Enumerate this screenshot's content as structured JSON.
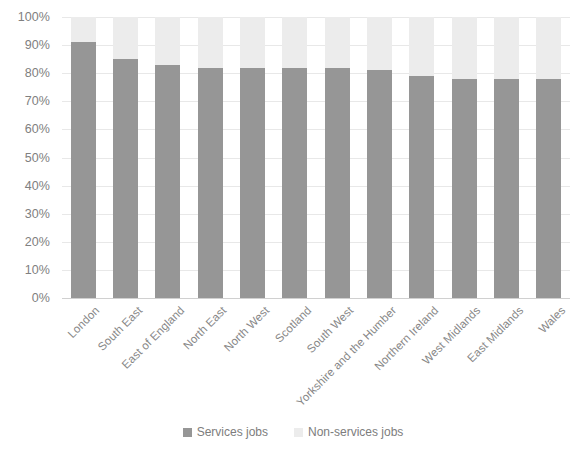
{
  "chart_data": {
    "type": "bar",
    "subtype": "stacked-percent-column",
    "title": "",
    "subtitle": "",
    "xlabel": "",
    "ylabel": "",
    "ylim": [
      0,
      100
    ],
    "y_tick_labels": [
      "0%",
      "10%",
      "20%",
      "30%",
      "40%",
      "50%",
      "60%",
      "70%",
      "80%",
      "90%",
      "100%"
    ],
    "y_tick_values": [
      0,
      10,
      20,
      30,
      40,
      50,
      60,
      70,
      80,
      90,
      100
    ],
    "grid": true,
    "grid_axis": "y",
    "legend_position": "bottom",
    "categories": [
      "London",
      "South East",
      "East of England",
      "North East",
      "North West",
      "Scotland",
      "South West",
      "Yorkshire and the Humber",
      "Northern Ireland",
      "West Midlands",
      "East Midlands",
      "Wales"
    ],
    "series": [
      {
        "name": "Services jobs",
        "color": "#969696",
        "values": [
          91,
          85,
          83,
          82,
          82,
          82,
          82,
          81,
          79,
          78,
          78,
          78
        ]
      },
      {
        "name": "Non-services jobs",
        "color": "#ececec",
        "values": [
          9,
          15,
          17,
          18,
          18,
          18,
          18,
          19,
          21,
          22,
          22,
          22
        ]
      }
    ]
  },
  "legend": {
    "items": [
      {
        "label": "Services jobs",
        "color": "#969696"
      },
      {
        "label": "Non-services jobs",
        "color": "#ececec"
      }
    ]
  },
  "colors": {
    "services": "#969696",
    "non_services": "#ececec",
    "gridline": "#e8e8e8",
    "tick_text": "#808080",
    "background": "#ffffff"
  }
}
